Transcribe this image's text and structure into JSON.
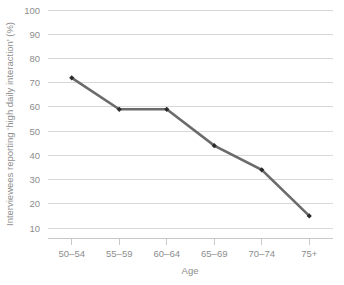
{
  "chart_data": {
    "type": "line",
    "title": "",
    "subtitle": "",
    "xlabel": "Age",
    "ylabel": "Interviewees reporting ‘high daily interaction’ (%)",
    "categories": [
      "50–54",
      "55–59",
      "60–64",
      "65–69",
      "70–74",
      "75+"
    ],
    "values": [
      72,
      59,
      59,
      44,
      34,
      15
    ],
    "series": [
      {
        "name": "Interviewees reporting ‘high daily interaction’",
        "values": [
          72,
          59,
          59,
          44,
          34,
          15
        ]
      }
    ],
    "ylim": [
      10,
      100
    ],
    "ytick_labels": [
      "100",
      "90",
      "80",
      "70",
      "60",
      "50",
      "40",
      "30",
      "20",
      "10"
    ],
    "ytick_values": [
      100,
      90,
      80,
      70,
      60,
      50,
      40,
      30,
      20,
      10
    ],
    "ytick_step": 10,
    "grid": "horizontal",
    "legend": "none",
    "annotations": [],
    "colors": {
      "line": "#6b6b6b",
      "marker": "#2b2b2b",
      "gridline": "#d8d8d8",
      "axis": "#c9c9c9",
      "text": "#8d8d8d",
      "background": "#ffffff"
    }
  }
}
